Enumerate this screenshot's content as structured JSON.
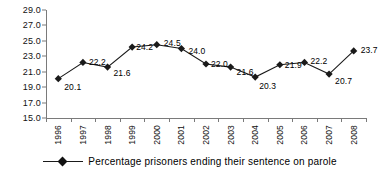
{
  "chart_data": {
    "type": "line",
    "title": "",
    "subtitle": "",
    "xlabel": "",
    "ylabel": "",
    "categories": [
      "1996",
      "1997",
      "1998",
      "1999",
      "2000",
      "2001",
      "2002",
      "2003",
      "2004",
      "2005",
      "2006",
      "2007",
      "2008"
    ],
    "series": [
      {
        "name": "Percentage prisoners ending their sentence on parole",
        "values": [
          20.1,
          22.2,
          21.6,
          24.2,
          24.5,
          24.0,
          22.0,
          21.6,
          20.3,
          21.9,
          22.2,
          20.7,
          23.7
        ],
        "marker": "diamond",
        "color": "#1a1a1a"
      }
    ],
    "data_labels": [
      "20.1",
      "22.2",
      "21.6",
      "24.2",
      "24.5",
      "24.0",
      "22.0",
      "21.6",
      "20.3",
      "21.9",
      "22.2",
      "20.7",
      "23.7"
    ],
    "ylim": [
      15.0,
      29.0
    ],
    "ytick_values": [
      15.0,
      17.0,
      19.0,
      21.0,
      23.0,
      25.0,
      27.0,
      29.0
    ],
    "ytick_labels": [
      "15.0",
      "17.0",
      "19.0",
      "21.0",
      "23.0",
      "25.0",
      "27.0",
      "29.0"
    ],
    "grid": false,
    "legend_position": "bottom",
    "axis_color": "#7a7a7a"
  },
  "legend": {
    "entries": [
      {
        "label": "Percentage prisoners ending their sentence on parole"
      }
    ]
  }
}
